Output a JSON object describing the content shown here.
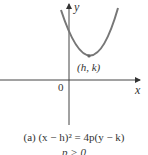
{
  "figure": {
    "axes": {
      "y_label": "y",
      "x_label": "x",
      "origin_label": "0"
    },
    "vertex_label": "(h, k)",
    "caption_line1": "(a)  (x − h)² = 4p(y − k)",
    "caption_line2": "p > 0",
    "colors": {
      "curve": "#777777",
      "axes": "#444444",
      "vertex": "#666666"
    }
  }
}
